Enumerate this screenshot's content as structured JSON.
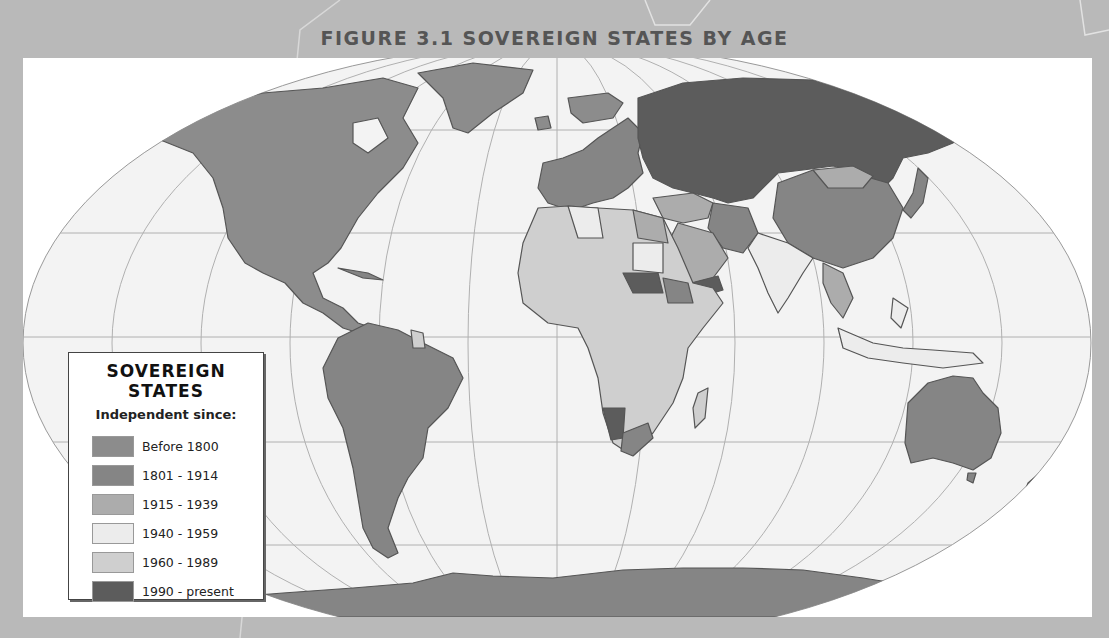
{
  "title": "FIGURE 3.1 SOVEREIGN STATES BY AGE",
  "legend": {
    "title": "SOVEREIGN STATES",
    "subtitle": "Independent since:",
    "items": [
      {
        "label": "Before 1800",
        "color": "#8c8c8c"
      },
      {
        "label": "1801 - 1914",
        "color": "#858585"
      },
      {
        "label": "1915 - 1939",
        "color": "#acacac"
      },
      {
        "label": "1940 - 1959",
        "color": "#ececec"
      },
      {
        "label": "1960 - 1989",
        "color": "#cfcfcf"
      },
      {
        "label": "1990 - present",
        "color": "#5c5c5c"
      }
    ]
  },
  "colors": {
    "background": "#b9b9b9",
    "ocean": "#f3f3f3",
    "frame": "#ffffff",
    "grid": "#a8a8a8"
  }
}
